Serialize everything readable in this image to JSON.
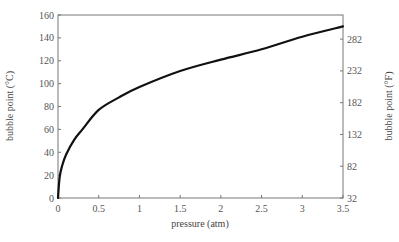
{
  "chart_data": {
    "type": "line",
    "title": "",
    "xlabel": "pressure (atm)",
    "ylabel": "bubble point (°C)",
    "y2label": "bubble point (°F)",
    "xlim": [
      0,
      3.5
    ],
    "ylim": [
      0,
      160
    ],
    "y2lim": [
      32,
      320
    ],
    "grid": false,
    "legend": null,
    "x_ticks": [
      "0",
      "0.5",
      "1",
      "1.5",
      "2",
      "2.5",
      "3",
      "3.5"
    ],
    "y_ticks": [
      "0",
      "20",
      "40",
      "60",
      "80",
      "100",
      "120",
      "140",
      "160"
    ],
    "y2_ticks": [
      "32",
      "82",
      "132",
      "182",
      "232",
      "282"
    ],
    "series": [
      {
        "name": "bubble point",
        "color": "#111111",
        "x": [
          0.0,
          0.02,
          0.05,
          0.1,
          0.2,
          0.3,
          0.5,
          0.75,
          1.0,
          1.5,
          2.0,
          2.5,
          3.0,
          3.5
        ],
        "y": [
          0,
          18,
          28,
          38,
          51,
          60,
          77,
          88,
          97,
          111,
          121,
          130,
          141,
          150
        ]
      }
    ]
  }
}
